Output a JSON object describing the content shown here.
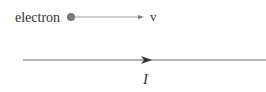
{
  "diagram": {
    "electron_label": "electron",
    "velocity_label": "v",
    "current_label": "I",
    "colors": {
      "electron_dot": "#7a7a7a",
      "line": "#666666",
      "text": "#333333"
    }
  }
}
